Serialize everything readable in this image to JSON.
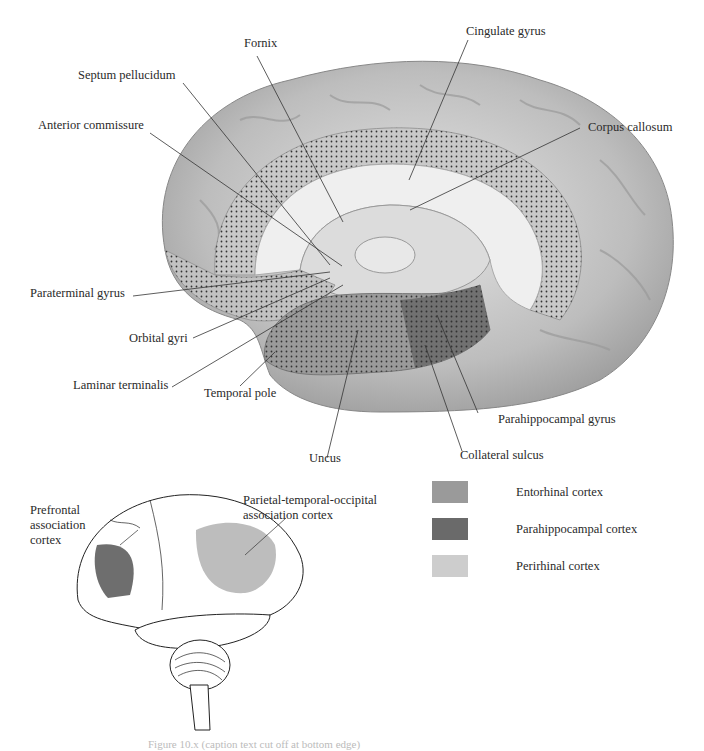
{
  "figure": {
    "medial_view": {
      "labels": [
        {
          "id": "fornix",
          "text": "Fornix"
        },
        {
          "id": "cingulate-gyrus",
          "text": "Cingulate gyrus"
        },
        {
          "id": "septum-pellucidum",
          "text": "Septum pellucidum"
        },
        {
          "id": "corpus-callosum",
          "text": "Corpus callosum"
        },
        {
          "id": "anterior-commissure",
          "text": "Anterior commissure"
        },
        {
          "id": "paraterminal-gyrus",
          "text": "Paraterminal gyrus"
        },
        {
          "id": "orbital-gyri",
          "text": "Orbital gyri"
        },
        {
          "id": "laminar-terminalis",
          "text": "Laminar terminalis"
        },
        {
          "id": "temporal-pole",
          "text": "Temporal pole"
        },
        {
          "id": "parahippocampal-gyrus",
          "text": "Parahippocampal gyrus"
        },
        {
          "id": "collateral-sulcus",
          "text": "Collateral sulcus"
        },
        {
          "id": "uncus",
          "text": "Uncus"
        }
      ]
    },
    "lateral_view": {
      "labels": [
        {
          "id": "prefrontal",
          "text": "Prefrontal\nassociation\ncortex"
        },
        {
          "id": "parietal-temporal-occipital",
          "text": "Parietal-temporal-occipital\nassociation cortex"
        }
      ],
      "region_colors": {
        "prefrontal": "#6e6e6e",
        "parietal": "#bdbdbd"
      }
    },
    "legend": [
      {
        "label": "Entorhinal cortex",
        "color": "#9a9a9a"
      },
      {
        "label": "Parahippocampal cortex",
        "color": "#6a6a6a"
      },
      {
        "label": "Perirhinal cortex",
        "color": "#cdcdcd"
      }
    ],
    "caption": "Figure 10.x  (caption text cut off at bottom edge)"
  }
}
